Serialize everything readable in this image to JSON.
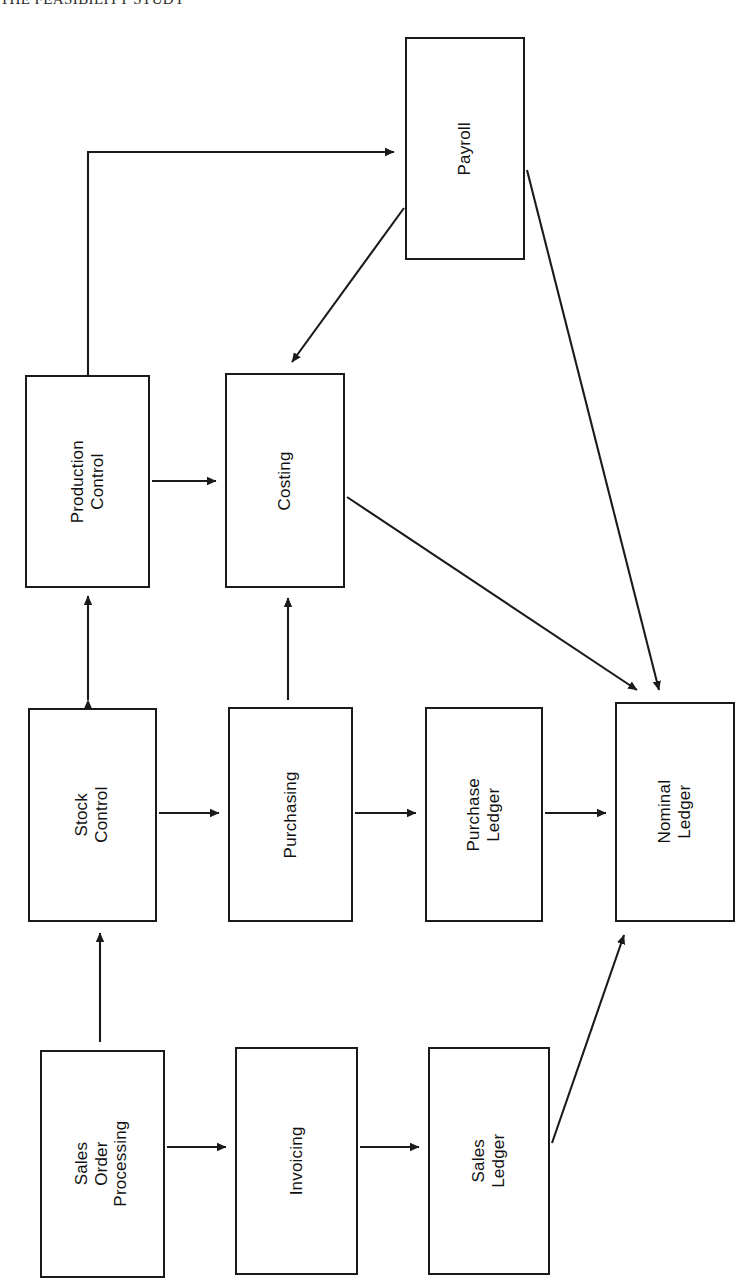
{
  "caption": "THE FEASIBILITY STUDY",
  "diagram": {
    "orientation": "rotated-90-left",
    "line_color": "#1a1a1a",
    "background_color": "#ffffff",
    "nodes": [
      {
        "id": "payroll",
        "label": "Payroll",
        "x": 405,
        "y": 37,
        "w": 120,
        "h": 223
      },
      {
        "id": "production",
        "label": "Production\nControl",
        "x": 25,
        "y": 375,
        "w": 125,
        "h": 213
      },
      {
        "id": "costing",
        "label": "Costing",
        "x": 225,
        "y": 373,
        "w": 120,
        "h": 215
      },
      {
        "id": "stock",
        "label": "Stock\nControl",
        "x": 28,
        "y": 708,
        "w": 129,
        "h": 214
      },
      {
        "id": "purchasing",
        "label": "Purchasing",
        "x": 228,
        "y": 707,
        "w": 125,
        "h": 215
      },
      {
        "id": "purchaseledger",
        "label": "Purchase\nLedger",
        "x": 425,
        "y": 707,
        "w": 118,
        "h": 215
      },
      {
        "id": "nominalledger",
        "label": "Nominal\nLedger",
        "x": 615,
        "y": 702,
        "w": 120,
        "h": 220
      },
      {
        "id": "sop",
        "label": "Sales\nOrder\nProcessing",
        "x": 40,
        "y": 1050,
        "w": 125,
        "h": 228
      },
      {
        "id": "invoicing",
        "label": "Invoicing",
        "x": 235,
        "y": 1047,
        "w": 123,
        "h": 228
      },
      {
        "id": "salesledger",
        "label": "Sales\nLedger",
        "x": 428,
        "y": 1047,
        "w": 122,
        "h": 228
      }
    ],
    "edges": [
      {
        "id": "production-to-payroll",
        "from": "Production Control",
        "to": "Payroll",
        "style": "orthogonal",
        "arrows": "single"
      },
      {
        "id": "payroll-to-costing",
        "from": "Payroll",
        "to": "Costing",
        "style": "diagonal",
        "arrows": "single"
      },
      {
        "id": "payroll-to-nominal",
        "from": "Payroll",
        "to": "Nominal Ledger",
        "style": "diagonal",
        "arrows": "single"
      },
      {
        "id": "production-to-costing",
        "from": "Production Control",
        "to": "Costing",
        "style": "straight",
        "arrows": "single"
      },
      {
        "id": "costing-to-nominal",
        "from": "Costing",
        "to": "Nominal Ledger",
        "style": "diagonal",
        "arrows": "single"
      },
      {
        "id": "stock-production",
        "from": "Stock Control",
        "to": "Production Control",
        "style": "straight",
        "arrows": "double"
      },
      {
        "id": "purchasing-to-costing",
        "from": "Purchasing",
        "to": "Costing",
        "style": "straight",
        "arrows": "single"
      },
      {
        "id": "stock-to-purchasing",
        "from": "Stock Control",
        "to": "Purchasing",
        "style": "straight",
        "arrows": "single"
      },
      {
        "id": "purchasing-to-pledger",
        "from": "Purchasing",
        "to": "Purchase Ledger",
        "style": "straight",
        "arrows": "single"
      },
      {
        "id": "pledger-to-nominal",
        "from": "Purchase Ledger",
        "to": "Nominal Ledger",
        "style": "straight",
        "arrows": "single"
      },
      {
        "id": "sop-to-stock",
        "from": "Sales Order Processing",
        "to": "Stock Control",
        "style": "straight",
        "arrows": "single"
      },
      {
        "id": "sop-to-invoicing",
        "from": "Sales Order Processing",
        "to": "Invoicing",
        "style": "straight",
        "arrows": "single"
      },
      {
        "id": "invoicing-to-sledger",
        "from": "Invoicing",
        "to": "Sales Ledger",
        "style": "straight",
        "arrows": "single"
      },
      {
        "id": "sledger-to-nominal",
        "from": "Sales Ledger",
        "to": "Nominal Ledger",
        "style": "diagonal",
        "arrows": "single"
      }
    ]
  }
}
